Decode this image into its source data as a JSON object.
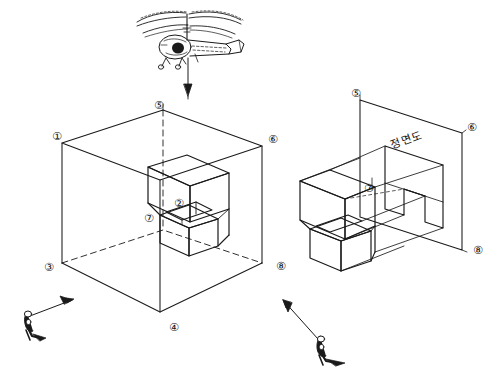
{
  "figure": {
    "background_color": "#ffffff",
    "line_color": "#1a1a1a"
  },
  "helicopter": {
    "name": "helicopter-icon",
    "description": "observer helicopter hovering above the glass box",
    "arrow_direction": "down"
  },
  "left_scene": {
    "name": "glass-box-scene",
    "corner_labels": [
      {
        "id": "c1",
        "text": "①",
        "x": 52,
        "y": 131
      },
      {
        "id": "c5",
        "text": "⑤",
        "x": 154,
        "y": 100
      },
      {
        "id": "c6",
        "text": "⑥",
        "x": 268,
        "y": 134
      },
      {
        "id": "c3",
        "text": "③",
        "x": 44,
        "y": 262
      },
      {
        "id": "c4",
        "text": "④",
        "x": 169,
        "y": 322
      },
      {
        "id": "c8",
        "text": "⑧",
        "x": 276,
        "y": 261
      }
    ],
    "object_labels": [
      {
        "id": "o2",
        "text": "②",
        "x": 174,
        "y": 198
      },
      {
        "id": "o7",
        "text": "⑦",
        "x": 144,
        "y": 213
      }
    ]
  },
  "right_scene": {
    "name": "projection-plane-scene",
    "plane_label": "정면도",
    "plane_label_meaning": "front view",
    "corner_labels": [
      {
        "id": "r5",
        "text": "⑤",
        "x": 351,
        "y": 88
      },
      {
        "id": "r6",
        "text": "⑥",
        "x": 467,
        "y": 122
      },
      {
        "id": "r7",
        "text": "⑦",
        "x": 364,
        "y": 183
      },
      {
        "id": "r8",
        "text": "⑧",
        "x": 473,
        "y": 245
      }
    ]
  },
  "observers": [
    {
      "id": "observer-left",
      "name": "observer-figure-left",
      "arrow_direction": "up-right"
    },
    {
      "id": "observer-right",
      "name": "observer-figure-right",
      "arrow_direction": "up-left"
    }
  ]
}
